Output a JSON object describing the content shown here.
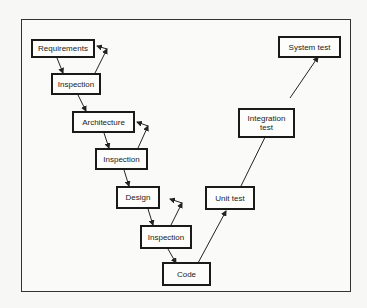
{
  "diagram": {
    "type": "V-model",
    "nodes": [
      {
        "id": "requirements",
        "label": "Requirements"
      },
      {
        "id": "inspection-1",
        "label": "Inspection"
      },
      {
        "id": "architecture",
        "label": "Architecture"
      },
      {
        "id": "inspection-2",
        "label": "Inspection"
      },
      {
        "id": "design",
        "label": "Design"
      },
      {
        "id": "inspection-3",
        "label": "Inspection"
      },
      {
        "id": "code",
        "label": "Code"
      },
      {
        "id": "unit-test",
        "label": "Unit test"
      },
      {
        "id": "integration-test",
        "label": "Integration\ntest"
      },
      {
        "id": "system-test",
        "label": "System test"
      }
    ],
    "edges": [
      {
        "from": "requirements",
        "to": "inspection-1"
      },
      {
        "from": "inspection-1",
        "to": "requirements",
        "kind": "feedback"
      },
      {
        "from": "inspection-1",
        "to": "architecture"
      },
      {
        "from": "architecture",
        "to": "inspection-2"
      },
      {
        "from": "inspection-2",
        "to": "architecture",
        "kind": "feedback"
      },
      {
        "from": "inspection-2",
        "to": "design"
      },
      {
        "from": "design",
        "to": "inspection-3"
      },
      {
        "from": "inspection-3",
        "to": "design",
        "kind": "feedback"
      },
      {
        "from": "inspection-3",
        "to": "code"
      },
      {
        "from": "code",
        "to": "unit-test"
      },
      {
        "from": "unit-test",
        "to": "integration-test"
      },
      {
        "from": "integration-test",
        "to": "system-test"
      }
    ]
  }
}
